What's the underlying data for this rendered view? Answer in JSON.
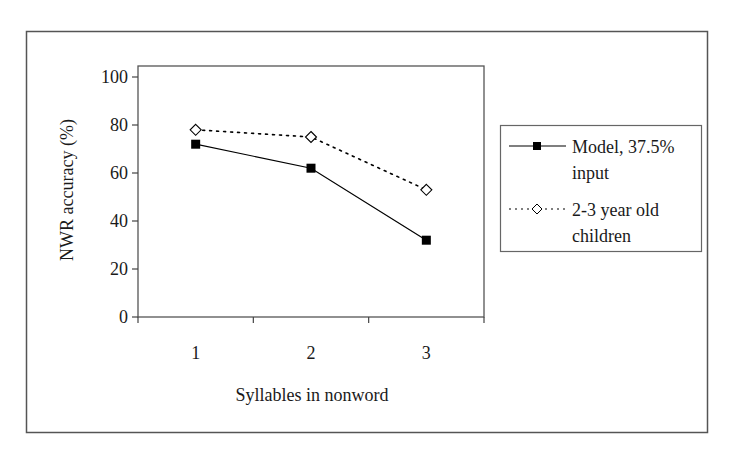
{
  "chart_data": {
    "type": "line",
    "title": "",
    "xlabel": "Syllables in nonword",
    "ylabel": "NWR accuracy (%)",
    "categories": [
      "1",
      "2",
      "3"
    ],
    "ylim": [
      0,
      100
    ],
    "yticks": [
      0,
      20,
      40,
      60,
      80,
      100
    ],
    "grid": false,
    "legend_position": "right",
    "series": [
      {
        "name": "Model, 37.5% input",
        "legend_lines": [
          "Model, 37.5%",
          "input"
        ],
        "values": [
          72,
          62,
          32
        ],
        "line_style": "solid",
        "marker": "filled-square",
        "color": "#000000"
      },
      {
        "name": "2-3 year old children",
        "legend_lines": [
          "2-3 year old",
          "children"
        ],
        "values": [
          78,
          75,
          53
        ],
        "line_style": "dotted",
        "marker": "open-diamond",
        "color": "#000000"
      }
    ]
  },
  "colors": {
    "frame": "#555555",
    "axis": "#444444",
    "background": "#ffffff"
  }
}
